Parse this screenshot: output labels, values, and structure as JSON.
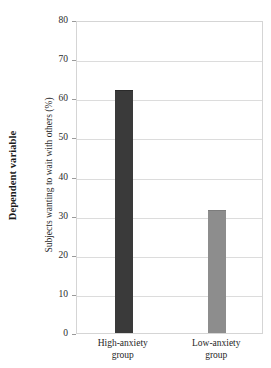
{
  "chart_data": {
    "type": "bar",
    "title": "",
    "subtitle": "",
    "outer_axis_title": "Dependent variable",
    "ylabel": "Subjects wanting to wait with others (%)",
    "xlabel": "",
    "categories": [
      "High-anxiety group",
      "Low-anxiety group"
    ],
    "category_lines": [
      [
        "High-anxiety",
        "group"
      ],
      [
        "Low-anxiety",
        "group"
      ]
    ],
    "values": [
      62,
      31.5
    ],
    "ylim": [
      0,
      80
    ],
    "ytick_step": 10,
    "yticks": [
      0,
      10,
      20,
      30,
      40,
      50,
      60,
      70,
      80
    ],
    "ytick_labels": [
      "0",
      "10",
      "20",
      "30",
      "40",
      "50",
      "60",
      "70",
      "80"
    ],
    "grid": true,
    "grid_axis": "y",
    "legend": false,
    "legend_position": "none",
    "bar_colors": [
      "#3a3a3a",
      "#8d8d8d"
    ],
    "bar_edge_colors": [
      "#2a2a2a",
      "#7c7c7c"
    ],
    "grid_color": "#dcdcdc",
    "frame_color": "#d5d5d5",
    "background_color": "#ffffff",
    "text_color": "#262626"
  }
}
